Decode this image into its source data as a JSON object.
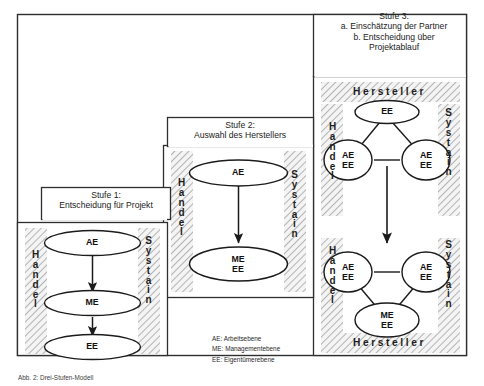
{
  "figure": {
    "caption": "Abb. 2:  Drei-Stufen-Modell"
  },
  "stages": [
    {
      "id": "stufe-1",
      "title_line1": "Stufe 1:",
      "title_line2": "Entscheidung für Projekt",
      "left_band": "Handel",
      "right_band": "Systain",
      "nodes": [
        {
          "label": "AE"
        },
        {
          "label": "ME"
        },
        {
          "label": "EE"
        }
      ],
      "connectors": "vertical-arrows-downward"
    },
    {
      "id": "stufe-2",
      "title_line1": "Stufe 2:",
      "title_line2": "Auswahl des Herstellers",
      "left_band": "Handel",
      "right_band": "Systain",
      "nodes": [
        {
          "label": "AE"
        },
        {
          "label": "ME\nEE"
        }
      ],
      "connectors": "vertical-arrow-downward"
    },
    {
      "id": "stufe-3",
      "title_line1": "Stufe 3:",
      "title_line2": "a. Einschätzung der Partner",
      "title_line3": "b. Entscheidung über",
      "title_line4": "Projektablauf",
      "left_band": "Handel",
      "right_band": "Systain",
      "top_band": "Hersteller",
      "bottom_band": "Hersteller",
      "cluster_top": {
        "nodes": [
          {
            "label": "EE"
          },
          {
            "label": "AE\nEE"
          },
          {
            "label": "AE\nEE"
          }
        ],
        "connectors": "triangle"
      },
      "cluster_bottom": {
        "nodes": [
          {
            "label": "AE\nEE"
          },
          {
            "label": "AE\nEE"
          },
          {
            "label": "ME\nEE"
          }
        ],
        "connectors": "triangle"
      },
      "between_clusters": "arrow-downward"
    }
  ],
  "legend": [
    "AE: Arbeitsebene",
    "ME: Managementebene",
    "EE: Eigentümerebene"
  ],
  "colors": {
    "ink": "#1a1a1a",
    "frame": "#303030",
    "hatch": "#9a9a9a",
    "band_fill": "#f2f2f2",
    "page": "#ffffff"
  }
}
